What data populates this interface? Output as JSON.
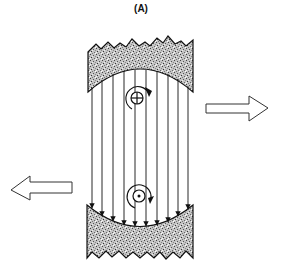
{
  "figure": {
    "panel_label": "(A)",
    "elements": {
      "top_magnet": "shaded pole piece with concave lower face",
      "bottom_magnet": "shaded pole piece with concave upper face",
      "field_lines": {
        "count": 10,
        "direction": "downward"
      },
      "top_conductor": {
        "symbol": "cross-in-circle (current into page)",
        "rotation": "clockwise arrow"
      },
      "bottom_conductor": {
        "symbol": "dot-in-circle (current out of page)",
        "rotation": "counter-clockwise arrow"
      },
      "right_arrow": "hollow arrow pointing right",
      "left_arrow": "hollow arrow pointing left"
    },
    "colors": {
      "stroke": "#111111",
      "magnet_fill": "#b5b5b5",
      "background": "#ffffff"
    }
  }
}
